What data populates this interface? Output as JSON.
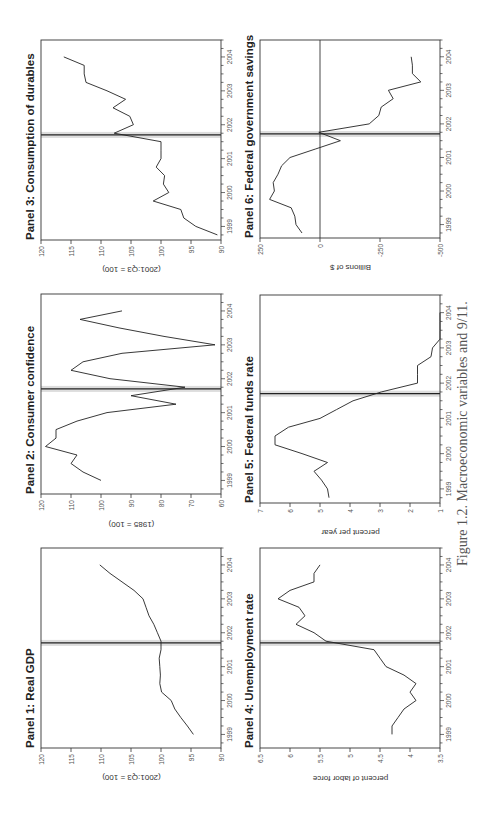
{
  "caption": "Figure 1.2. Macroeconomic variables and 9/11.",
  "event_marker": {
    "label": "9/11",
    "x": 2001.7,
    "line_color": "#222222",
    "shade_color": "#dddddd"
  },
  "chart_data": [
    {
      "id": "panel1",
      "type": "line",
      "title": "Panel 1: Real GDP",
      "xlabel": "",
      "ylabel": "(2001:Q3 = 100)",
      "xlim": [
        1998.6,
        2004.5
      ],
      "ylim": [
        90,
        120
      ],
      "yticks": [
        90,
        95,
        100,
        105,
        110,
        115,
        120
      ],
      "xticks": [
        1999,
        2000,
        2001,
        2002,
        2003,
        2004
      ],
      "x": [
        1999.0,
        1999.25,
        1999.5,
        1999.75,
        2000.0,
        2000.25,
        2000.5,
        2000.75,
        2001.0,
        2001.25,
        2001.5,
        2001.75,
        2002.0,
        2002.25,
        2002.5,
        2002.75,
        2003.0,
        2003.25,
        2003.5,
        2003.75,
        2004.0
      ],
      "values": [
        94.6,
        95.6,
        96.7,
        97.7,
        98.3,
        99.9,
        100.2,
        100.1,
        100.2,
        100.3,
        100.0,
        100.0,
        100.6,
        101.2,
        102.0,
        102.5,
        103.0,
        104.5,
        106.5,
        108.5,
        110.2
      ]
    },
    {
      "id": "panel2",
      "type": "line",
      "title": "Panel 2: Consumer confidence",
      "xlabel": "",
      "ylabel": "(1985 = 100)",
      "xlim": [
        1998.6,
        2004.5
      ],
      "ylim": [
        60,
        120
      ],
      "yticks": [
        60,
        70,
        80,
        90,
        100,
        110,
        120
      ],
      "xticks": [
        1999,
        2000,
        2001,
        2002,
        2003,
        2004
      ],
      "x": [
        1999.0,
        1999.25,
        1999.5,
        1999.75,
        2000.0,
        2000.25,
        2000.5,
        2000.75,
        2001.0,
        2001.25,
        2001.5,
        2001.75,
        2002.0,
        2002.25,
        2002.5,
        2002.75,
        2003.0,
        2003.25,
        2003.5,
        2003.75,
        2004.0
      ],
      "values": [
        100.0,
        106.0,
        110.0,
        108.0,
        118.5,
        115.0,
        115.0,
        108.0,
        98.0,
        75.0,
        90.0,
        72.0,
        97.0,
        110.0,
        106.0,
        93.0,
        62.0,
        79.0,
        94.0,
        107.0,
        93.0,
        104.0
      ]
    },
    {
      "id": "panel3",
      "type": "line",
      "title": "Panel 3: Consumption of durables",
      "xlabel": "",
      "ylabel": "(2001:Q3 = 100)",
      "xlim": [
        1998.6,
        2004.5
      ],
      "ylim": [
        90,
        120
      ],
      "yticks": [
        90,
        95,
        100,
        105,
        110,
        115,
        120
      ],
      "xticks": [
        1999,
        2000,
        2001,
        2002,
        2003,
        2004
      ],
      "x": [
        1998.75,
        1999.0,
        1999.25,
        1999.5,
        1999.75,
        2000.0,
        2000.25,
        2000.5,
        2000.75,
        2001.0,
        2001.25,
        2001.5,
        2001.75,
        2002.0,
        2002.25,
        2002.5,
        2002.75,
        2003.0,
        2003.25,
        2003.5,
        2003.75,
        2004.0
      ],
      "values": [
        90.6,
        94.2,
        96.2,
        96.7,
        101.3,
        98.7,
        99.6,
        99.4,
        100.8,
        100.0,
        100.0,
        100.0,
        107.8,
        104.6,
        105.2,
        108.0,
        105.9,
        109.0,
        112.5,
        112.8,
        112.8,
        116.2
      ]
    },
    {
      "id": "panel4",
      "type": "line",
      "title": "Panel 4: Unemployment rate",
      "xlabel": "",
      "ylabel": "percent of labor force",
      "xlim": [
        1998.6,
        2004.5
      ],
      "ylim": [
        3.5,
        6.5
      ],
      "yticks": [
        3.5,
        4.0,
        4.5,
        5.0,
        5.5,
        6.0,
        6.5
      ],
      "xticks": [
        1999,
        2000,
        2001,
        2002,
        2003,
        2004
      ],
      "x": [
        1999.0,
        1999.25,
        1999.5,
        1999.75,
        2000.0,
        2000.25,
        2000.5,
        2000.75,
        2001.0,
        2001.25,
        2001.5,
        2001.75,
        2002.0,
        2002.25,
        2002.5,
        2002.75,
        2003.0,
        2003.25,
        2003.5,
        2003.75,
        2004.0
      ],
      "values": [
        4.3,
        4.3,
        4.2,
        4.1,
        3.9,
        4.0,
        3.9,
        4.1,
        4.4,
        4.5,
        4.6,
        5.4,
        5.6,
        5.9,
        5.75,
        5.85,
        6.2,
        6.0,
        5.6,
        5.6,
        5.5
      ]
    },
    {
      "id": "panel5",
      "type": "line",
      "title": "Panel 5: Federal funds rate",
      "xlabel": "",
      "ylabel": "percent per year",
      "xlim": [
        1998.6,
        2004.5
      ],
      "ylim": [
        1,
        7
      ],
      "yticks": [
        1,
        2,
        3,
        4,
        5,
        6,
        7
      ],
      "xticks": [
        1999,
        2000,
        2001,
        2002,
        2003,
        2004
      ],
      "x": [
        1998.75,
        1999.0,
        1999.25,
        1999.5,
        1999.75,
        2000.0,
        2000.25,
        2000.5,
        2000.75,
        2001.0,
        2001.25,
        2001.5,
        2001.75,
        2002.0,
        2002.25,
        2002.5,
        2002.75,
        2003.0,
        2003.25,
        2003.5,
        2003.75,
        2004.0
      ],
      "values": [
        4.7,
        4.75,
        4.95,
        5.2,
        4.75,
        5.6,
        6.5,
        6.5,
        6.05,
        5.0,
        4.45,
        3.9,
        2.95,
        1.75,
        1.75,
        1.75,
        1.3,
        1.25,
        1.0,
        1.0,
        1.0,
        1.0,
        1.3
      ]
    },
    {
      "id": "panel6",
      "type": "line",
      "title": "Panel 6: Federal government savings",
      "xlabel": "",
      "ylabel": "Billions of $",
      "xlim": [
        1998.6,
        2004.5
      ],
      "ylim": [
        -500,
        250
      ],
      "yticks": [
        -500,
        -250,
        0,
        250
      ],
      "xticks": [
        1999,
        2000,
        2001,
        2002,
        2003,
        2004
      ],
      "zero_line": true,
      "x": [
        1998.75,
        1999.0,
        1999.25,
        1999.5,
        1999.75,
        2000.0,
        2000.25,
        2000.5,
        2000.75,
        2001.0,
        2001.25,
        2001.5,
        2001.75,
        2002.0,
        2002.25,
        2002.5,
        2002.75,
        2003.0,
        2003.25,
        2003.5,
        2003.75,
        2004.0
      ],
      "values": [
        75,
        100,
        105,
        120,
        210,
        190,
        195,
        175,
        160,
        125,
        20,
        -85,
        5,
        -205,
        -245,
        -255,
        -305,
        -285,
        -420,
        -385,
        -385,
        -380
      ]
    }
  ]
}
